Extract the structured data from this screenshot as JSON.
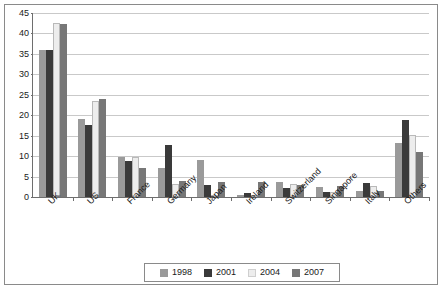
{
  "chart_data": {
    "type": "bar",
    "title": "",
    "xlabel": "",
    "ylabel": "",
    "ylim": [
      0,
      45
    ],
    "ytick_step": 5,
    "yticks": [
      0,
      5,
      10,
      15,
      20,
      25,
      30,
      35,
      40,
      45
    ],
    "grid": true,
    "legend_position": "bottom",
    "categories": [
      "UK",
      "US",
      "France",
      "Germany",
      "Japan",
      "Ireland",
      "Switzerland",
      "Singapore",
      "Italy",
      "Others"
    ],
    "series": [
      {
        "name": "1998",
        "color": "#9a9a9a",
        "values": [
          36.0,
          19.1,
          9.7,
          7.2,
          9.0,
          0.5,
          3.6,
          2.5,
          1.5,
          13.2
        ]
      },
      {
        "name": "2001",
        "color": "#3a3a3a",
        "values": [
          36.0,
          17.7,
          8.7,
          12.7,
          3.0,
          1.0,
          2.2,
          1.2,
          3.5,
          18.8
        ]
      },
      {
        "name": "2004",
        "color": "#ededed",
        "values": [
          42.5,
          23.5,
          9.7,
          3.2,
          0.2,
          0.2,
          3.1,
          1.2,
          2.8,
          15.2
        ]
      },
      {
        "name": "2007",
        "color": "#777777",
        "values": [
          42.4,
          24.0,
          7.2,
          3.9,
          3.6,
          3.6,
          3.0,
          2.8,
          1.4,
          10.9
        ]
      }
    ]
  },
  "legend": {
    "entries": [
      {
        "label": "1998",
        "color": "#9a9a9a"
      },
      {
        "label": "2001",
        "color": "#3a3a3a"
      },
      {
        "label": "2004",
        "color": "#ededed"
      },
      {
        "label": "2007",
        "color": "#777777"
      }
    ]
  },
  "axes": {
    "y_tick_labels": [
      "0",
      "5",
      "10",
      "15",
      "20",
      "25",
      "30",
      "35",
      "40",
      "45"
    ],
    "x_tick_labels": [
      "UK",
      "US",
      "France",
      "Germany",
      "Japan",
      "Ireland",
      "Switzerland",
      "Singapore",
      "Italy",
      "Others"
    ]
  },
  "colors": {
    "axis": "#6e6e6e",
    "grid": "#c9c9c9",
    "frame": "#8a8a8a",
    "text": "#1a1a1a",
    "background": "#ffffff"
  }
}
